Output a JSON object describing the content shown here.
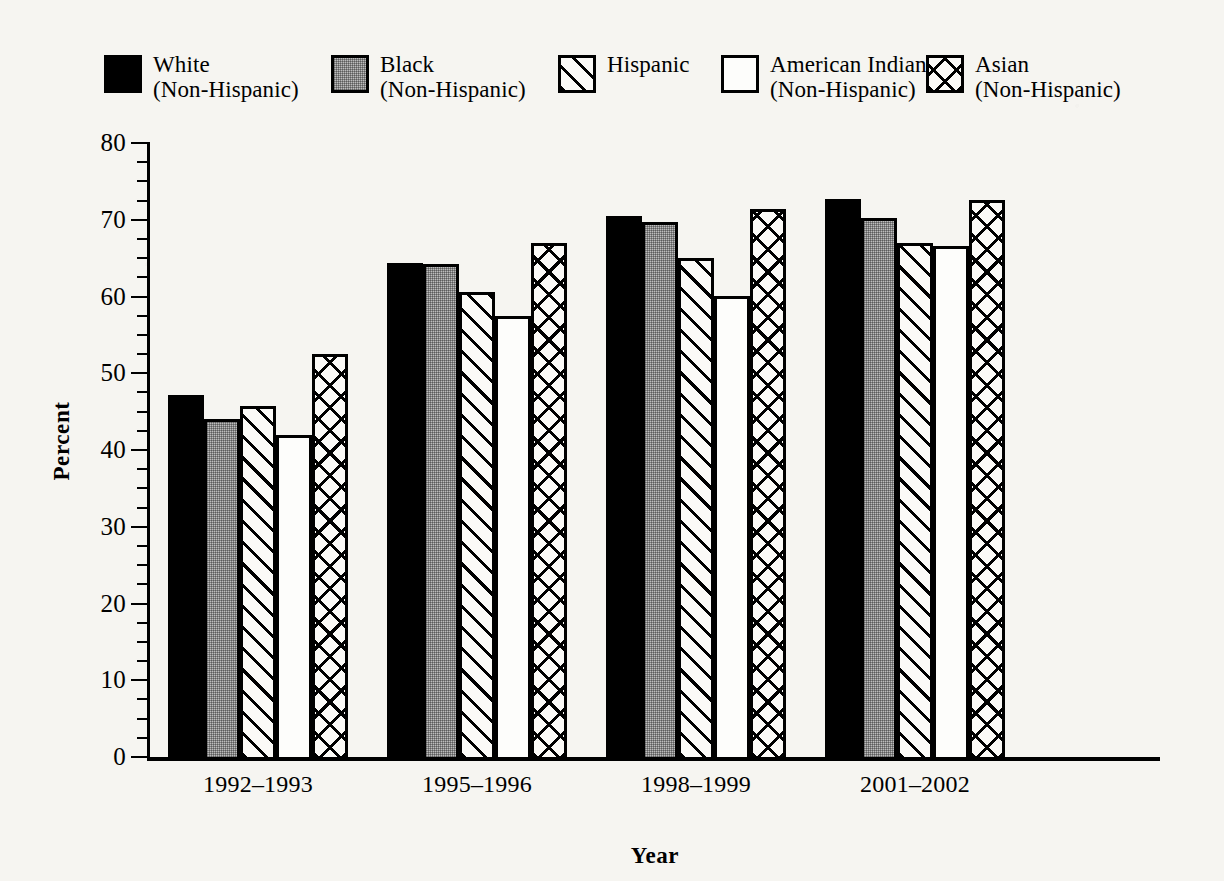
{
  "chart_data": {
    "type": "bar",
    "title": "",
    "subtitle": "",
    "xlabel": "Year",
    "ylabel": "Percent",
    "categories": [
      "1992–1993",
      "1995–1996",
      "1998–1999",
      "2001–2002"
    ],
    "series": [
      {
        "name": "White (Non-Hispanic)",
        "values": [
          47.2,
          64.4,
          70.5,
          72.7
        ]
      },
      {
        "name": "Black (Non-Hispanic)",
        "values": [
          44.1,
          64.2,
          69.7,
          70.2
        ]
      },
      {
        "name": "Hispanic",
        "values": [
          45.8,
          60.6,
          65.0,
          67.0
        ]
      },
      {
        "name": "American Indian (Non-Hispanic)",
        "values": [
          42.0,
          57.4,
          60.1,
          66.6
        ]
      },
      {
        "name": "Asian (Non-Hispanic)",
        "values": [
          52.5,
          67.0,
          71.4,
          72.6
        ]
      }
    ],
    "ylim": [
      0,
      80
    ],
    "ytick_labels": [
      "0",
      "10",
      "20",
      "30",
      "40",
      "50",
      "60",
      "70",
      "80"
    ],
    "ytick_values": [
      0,
      10,
      20,
      30,
      40,
      50,
      60,
      70,
      80
    ],
    "minor_tick_step": 2.5,
    "grid": false,
    "legend_position": "top"
  },
  "legend": {
    "entries": [
      {
        "line1": "White",
        "line2": "(Non-Hispanic)",
        "pattern": "solid-black"
      },
      {
        "line1": "Black",
        "line2": "(Non-Hispanic)",
        "pattern": "gray-stipple"
      },
      {
        "line1": "Hispanic",
        "line2": "",
        "pattern": "diagonal-hatch"
      },
      {
        "line1": "American Indian",
        "line2": "(Non-Hispanic)",
        "pattern": "empty-white"
      },
      {
        "line1": "Asian",
        "line2": "(Non-Hispanic)",
        "pattern": "cross-hatch"
      }
    ]
  },
  "colors": {
    "ink": "#000000",
    "paper": "#f6f5f1",
    "gray_fill": "#bdbdbd",
    "white_fill": "#fdfdfb"
  }
}
